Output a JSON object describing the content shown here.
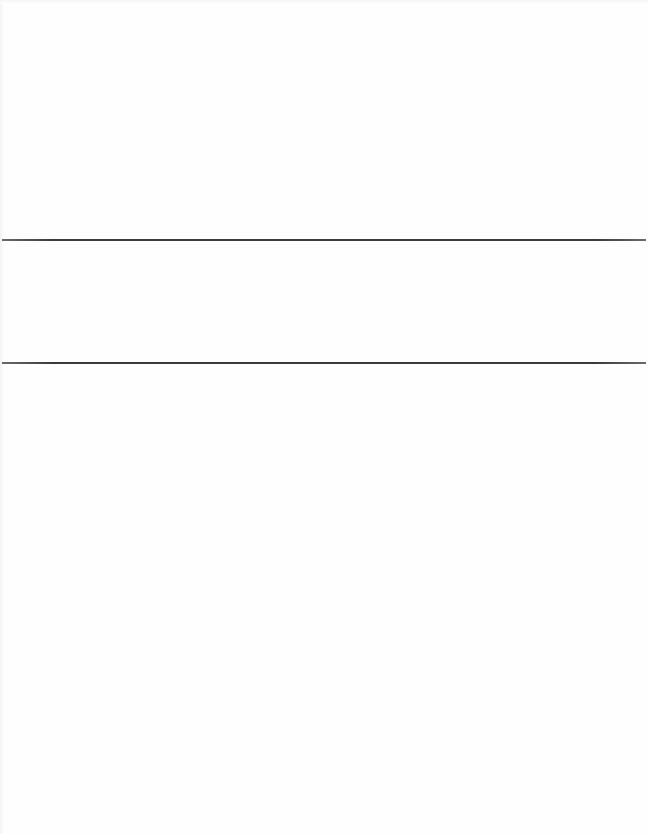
{
  "page": {
    "background_color": "#fefefe",
    "rule_color": "#3a3a3a",
    "rules": [
      {
        "id": "rule-1",
        "y": 240
      },
      {
        "id": "rule-2",
        "y": 363
      }
    ],
    "sections": {
      "top": {
        "text": ""
      },
      "middle": {
        "text": ""
      },
      "bottom": {
        "text": ""
      }
    }
  }
}
